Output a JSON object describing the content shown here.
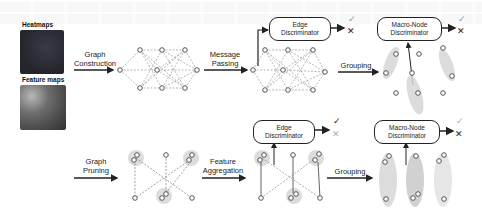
{
  "inputs": {
    "heatmaps_label": "Heatmaps",
    "feature_maps_label": "Feature maps",
    "feature_maps_sublabel": "(tags)"
  },
  "row1": {
    "steps": [
      {
        "label_line1": "Graph",
        "label_line2": "Construction"
      },
      {
        "label_line1": "Message",
        "label_line2": "Passing"
      },
      {
        "label_line1": "Grouping",
        "label_line2": ""
      }
    ],
    "edge_discriminator": {
      "line1": "Edge",
      "line2": "Discriminator"
    },
    "macro_node_discriminator": {
      "line1": "Macro-Node",
      "line2": "Discriminator"
    },
    "outputs": {
      "check": "✓",
      "cross": "✕"
    }
  },
  "row2": {
    "steps": [
      {
        "label_line1": "Graph",
        "label_line2": "Pruning"
      },
      {
        "label_line1": "Feature",
        "label_line2": "Aggregation"
      },
      {
        "label_line1": "Grouping",
        "label_line2": ""
      }
    ],
    "edge_discriminator": {
      "line1": "Edge",
      "line2": "Discriminator"
    },
    "macro_node_discriminator": {
      "line1": "Macro-Node",
      "line2": "Discriminator"
    },
    "outputs": {
      "check": "✓",
      "cross": "✕"
    }
  },
  "colors": {
    "node_stroke": "#555555",
    "group_fill": "#d6d6d6",
    "arrow": "#222222",
    "heatmap_dark": "#2c2c34",
    "check_active": "#222222",
    "check_faded": "#aaaaaa"
  }
}
